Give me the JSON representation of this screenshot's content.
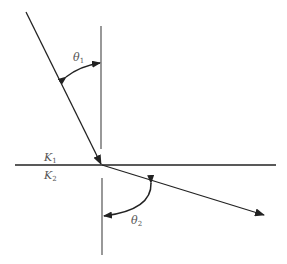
{
  "diagram": {
    "type": "refraction",
    "labels": {
      "theta1": {
        "symbol": "θ",
        "subscript": "1"
      },
      "theta2": {
        "symbol": "θ",
        "subscript": "2"
      },
      "k1": {
        "symbol": "K",
        "subscript": "1"
      },
      "k2": {
        "symbol": "K",
        "subscript": "2"
      }
    },
    "colors": {
      "line": "#222222",
      "normal": "#444444",
      "label": "#555555"
    }
  }
}
